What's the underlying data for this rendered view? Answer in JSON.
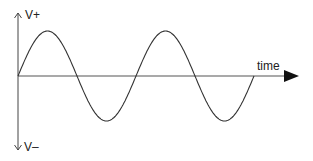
{
  "diagram": {
    "type": "sine-wave-voltage",
    "labels": {
      "y_positive": "V+",
      "y_negative": "V–",
      "x_axis": "time"
    },
    "wave": {
      "cycles": 2,
      "amplitude_px": 45,
      "period_px": 118,
      "zero_crossings_x": [
        18,
        77,
        136,
        195,
        254
      ]
    },
    "colors": {
      "line": "#333333",
      "axis": "#444444",
      "arrow": "#111111",
      "background": "#ffffff"
    }
  }
}
